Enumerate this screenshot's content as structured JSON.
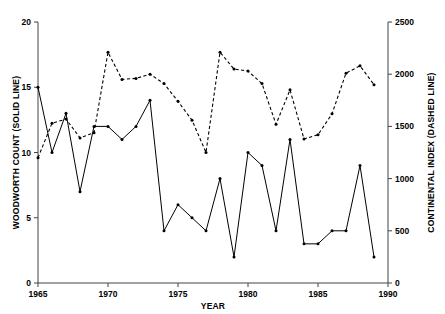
{
  "chart_data": {
    "type": "line",
    "title": "",
    "xlabel": "YEAR",
    "grid": false,
    "legend": "none",
    "x": [
      1965,
      1966,
      1967,
      1968,
      1969,
      1970,
      1971,
      1972,
      1973,
      1974,
      1975,
      1976,
      1977,
      1978,
      1979,
      1980,
      1981,
      1982,
      1983,
      1984,
      1985,
      1986,
      1987,
      1988,
      1989
    ],
    "xlim": [
      1965,
      1990
    ],
    "xticks": [
      1965,
      1970,
      1975,
      1980,
      1985,
      1990
    ],
    "xticklabels": [
      "1965",
      "1970",
      "1975",
      "1980",
      "1985",
      "1990"
    ],
    "axes": [
      {
        "id": "left",
        "label": "WOODWORTH COUNT (SOLID LINE)",
        "ylim": [
          0,
          20
        ],
        "yticks": [
          0,
          5,
          10,
          15,
          20
        ],
        "yticklabels": [
          "0",
          "5",
          "10",
          "15",
          "20"
        ]
      },
      {
        "id": "right",
        "label": "CONTINENTAL INDEX (DASHED LINE)",
        "ylim": [
          0,
          2500
        ],
        "yticks": [
          0,
          500,
          1000,
          1500,
          2000,
          2500
        ],
        "yticklabels": [
          "0",
          "500",
          "1000",
          "1500",
          "2000",
          "2500"
        ]
      }
    ],
    "series": [
      {
        "name": "WOODWORTH COUNT (SOLID LINE)",
        "axis": "left",
        "style": "solid",
        "marker": "dot",
        "values": [
          15,
          10,
          13,
          7,
          12,
          12,
          11,
          12,
          14,
          4,
          6,
          5,
          4,
          8,
          2,
          10,
          9,
          4,
          11,
          3,
          3,
          4,
          4,
          9,
          2
        ]
      },
      {
        "name": "CONTINENTAL INDEX (DASHED LINE)",
        "axis": "right",
        "style": "dashed",
        "marker": "dot",
        "values": [
          1200,
          1530,
          1570,
          1390,
          1440,
          2210,
          1950,
          1960,
          2000,
          1910,
          1740,
          1560,
          1250,
          2210,
          2050,
          2030,
          1910,
          1520,
          1850,
          1380,
          1420,
          1620,
          2010,
          2080,
          1900
        ]
      }
    ]
  }
}
